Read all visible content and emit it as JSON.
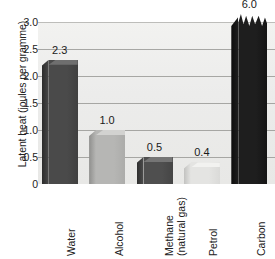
{
  "chart_data": {
    "type": "bar",
    "title": "",
    "xlabel": "",
    "ylabel": "Latent heat (joules per gramme)",
    "ylim": [
      0,
      3.0
    ],
    "ytick_labels": [
      "3.0",
      "2.5",
      "2.0",
      "1.5",
      "1.0",
      "0.5",
      "0"
    ],
    "ytick_values": [
      3.0,
      2.5,
      2.0,
      1.5,
      1.0,
      0.5,
      0
    ],
    "grid": true,
    "legend": null,
    "categories": [
      "Water",
      "Alcohol",
      "Methane (natural gas)",
      "Petrol",
      "Carbon"
    ],
    "values": [
      2.3,
      1.0,
      0.5,
      0.4,
      6.0
    ],
    "value_labels": [
      "2.3",
      "1.0",
      "0.5",
      "0.4",
      "6.0"
    ],
    "annotations": [
      "Carbon bar exceeds the axis maximum and is drawn with a torn/broken top edge"
    ],
    "bars": [
      {
        "category": "Water",
        "category_line1": "Water",
        "category_line2": "",
        "value": 2.3,
        "value_label": "2.3",
        "face_color": "#4a4a4a",
        "side_color": "#2b2b2b",
        "top_color": "#6f6f6f",
        "clipped": false
      },
      {
        "category": "Alcohol",
        "category_line1": "Alcohol",
        "category_line2": "",
        "value": 1.0,
        "value_label": "1.0",
        "face_color": "#b6b6b4",
        "side_color": "#8f8f8d",
        "top_color": "#d2d2d0",
        "clipped": false
      },
      {
        "category": "Methane (natural gas)",
        "category_line1": "Methane",
        "category_line2": "(natural gas)",
        "value": 0.5,
        "value_label": "0.5",
        "face_color": "#4f4f4f",
        "side_color": "#2e2e2e",
        "top_color": "#757575",
        "clipped": false
      },
      {
        "category": "Petrol",
        "category_line1": "Petrol",
        "category_line2": "",
        "value": 0.4,
        "value_label": "0.4",
        "face_color": "#e4e4e2",
        "side_color": "#c2c2c0",
        "top_color": "#f2f2f0",
        "clipped": false
      },
      {
        "category": "Carbon",
        "category_line1": "Carbon",
        "category_line2": "",
        "value": 6.0,
        "value_label": "6.0",
        "face_color": "#1e1e1e",
        "side_color": "#0c0c0c",
        "top_color": "#3a3a3a",
        "clipped": true
      }
    ],
    "colors": {
      "plot_background": "#ececeb",
      "gridline": "#9a9a96",
      "page_background": "#ffffff",
      "text": "#1a1a1a"
    }
  }
}
